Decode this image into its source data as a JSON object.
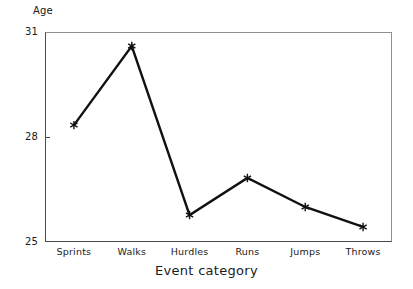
{
  "chart_data": {
    "type": "line",
    "title": "",
    "xlabel": "Event category",
    "ylabel": "Age",
    "categories": [
      "Sprints",
      "Walks",
      "Hurdles",
      "Runs",
      "Jumps",
      "Throws"
    ],
    "values": [
      28.34,
      30.6,
      25.77,
      26.83,
      26.0,
      25.43
    ],
    "series": [
      {
        "name": "Age",
        "values": [
          28.34,
          30.6,
          25.77,
          26.83,
          26.0,
          25.43
        ]
      }
    ],
    "ylim": [
      25,
      31
    ],
    "yticks": [
      25,
      28,
      31
    ],
    "ytick_labels": [
      "25",
      "28",
      "31"
    ],
    "grid": false,
    "legend": "none",
    "marker": "asterisk",
    "line_color": "#111111",
    "marker_color": "#111111",
    "axis_color": "#4a4a4a",
    "background": "#ffffff"
  },
  "axes": {
    "y_label": "Age",
    "x_label": "Event category",
    "y_ticks": [
      {
        "label": "31",
        "value": 31
      },
      {
        "label": "28",
        "value": 28
      },
      {
        "label": "25",
        "value": 25
      }
    ],
    "x_ticks": [
      {
        "label": "Sprints"
      },
      {
        "label": "Walks"
      },
      {
        "label": "Hurdles"
      },
      {
        "label": "Runs"
      },
      {
        "label": "Jumps"
      },
      {
        "label": "Throws"
      }
    ]
  }
}
